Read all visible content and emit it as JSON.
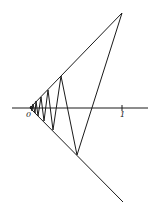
{
  "diagram": {
    "labels": {
      "origin": "0",
      "one": "1"
    },
    "colors": {
      "line": "#1a1a1a",
      "background": "#ffffff"
    },
    "axis": {
      "x1": 12,
      "x2": 148,
      "y": 108
    },
    "apex": [
      30,
      108
    ],
    "upper_ray_end": [
      122,
      13
    ],
    "lower_ray_end": [
      123,
      202
    ],
    "tick_x": 122,
    "zigzag": [
      [
        122,
        13
      ],
      [
        77,
        155
      ],
      [
        61,
        76
      ],
      [
        53,
        130
      ],
      [
        48,
        90
      ],
      [
        44,
        121
      ],
      [
        41,
        97
      ],
      [
        38,
        116
      ],
      [
        36,
        101
      ],
      [
        35,
        113
      ],
      [
        33,
        104
      ],
      [
        32,
        111
      ],
      [
        31,
        106
      ],
      [
        30,
        108
      ]
    ]
  }
}
